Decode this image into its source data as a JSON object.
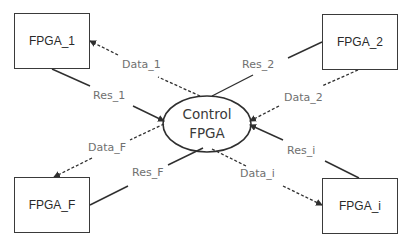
{
  "diagram": {
    "center_node": {
      "line1": "Control",
      "line2": "FPGA"
    },
    "nodes": [
      {
        "id": "fpga_1",
        "label": "FPGA_1"
      },
      {
        "id": "fpga_2",
        "label": "FPGA_2"
      },
      {
        "id": "fpga_f",
        "label": "FPGA_F"
      },
      {
        "id": "fpga_i",
        "label": "FPGA_i"
      }
    ],
    "edges": [
      {
        "label": "Data_1",
        "style": "dashed",
        "from": "Control FPGA",
        "to": "FPGA_1"
      },
      {
        "label": "Res_1",
        "style": "solid",
        "from": "FPGA_1",
        "to": "Control FPGA"
      },
      {
        "label": "Res_2",
        "style": "solid",
        "from": "FPGA_2",
        "to": "Control FPGA"
      },
      {
        "label": "Data_2",
        "style": "dashed",
        "from": "FPGA_2",
        "to": "Control FPGA"
      },
      {
        "label": "Data_F",
        "style": "dashed",
        "from": "Control FPGA",
        "to": "FPGA_F"
      },
      {
        "label": "Res_F",
        "style": "solid",
        "from": "FPGA_F",
        "to": "Control FPGA"
      },
      {
        "label": "Res_i",
        "style": "solid",
        "from": "FPGA_i",
        "to": "Control FPGA"
      },
      {
        "label": "Data_i",
        "style": "dashed",
        "from": "Control FPGA",
        "to": "FPGA_i"
      }
    ],
    "colors": {
      "line": "#2f2f2f",
      "box_border": "#3a3a3a",
      "edge_label": "#707070",
      "background": "#ffffff"
    }
  }
}
